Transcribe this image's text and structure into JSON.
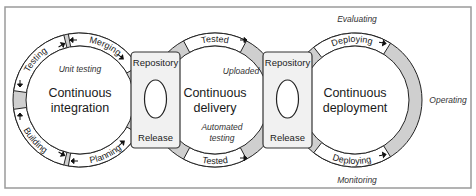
{
  "stages": [
    {
      "id": "ci",
      "title_lines": [
        "Continuous",
        "integration"
      ],
      "inner_note": "Unit testing",
      "segments": [
        "Merging",
        "Planning",
        "Building",
        "Testing"
      ]
    },
    {
      "id": "cd",
      "title_lines": [
        "Continuous",
        "delivery"
      ],
      "inner_notes": [
        "Uploaded",
        "Automated",
        "testing"
      ],
      "segments": [
        "Tested",
        "Tested"
      ]
    },
    {
      "id": "cdep",
      "title_lines": [
        "Continuous",
        "deployment"
      ],
      "segments": [
        "Deploying",
        "Deploying"
      ],
      "outer_notes": [
        "Evaluating",
        "Operating",
        "Monitoring"
      ]
    }
  ],
  "repositories": [
    {
      "top_label": "Repository",
      "bottom_label": "Release"
    },
    {
      "top_label": "Repository",
      "bottom_label": "Release"
    }
  ],
  "colors": {
    "ring_fill": "#cfcfcf",
    "repo_fill": "#f1f1f1",
    "stroke": "#222222"
  }
}
